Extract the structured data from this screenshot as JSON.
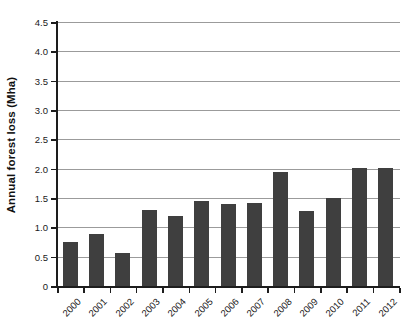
{
  "chart_data": {
    "type": "bar",
    "title": "",
    "xlabel": "",
    "ylabel": "Annual forest loss (Mha)",
    "categories": [
      "2000",
      "2001",
      "2002",
      "2003",
      "2004",
      "2005",
      "2006",
      "2007",
      "2008",
      "2009",
      "2010",
      "2011",
      "2012"
    ],
    "values": [
      0.75,
      0.88,
      0.56,
      1.3,
      1.19,
      1.45,
      1.4,
      1.41,
      1.95,
      1.28,
      1.5,
      2.02,
      2.02
    ],
    "series": [
      {
        "name": "Annual forest loss",
        "values": [
          0.75,
          0.88,
          0.56,
          1.3,
          1.19,
          1.45,
          1.4,
          1.41,
          1.95,
          1.28,
          1.5,
          2.02,
          2.02
        ]
      }
    ],
    "ylim": [
      0,
      4.5
    ],
    "ytick_labels": [
      "0",
      "0.5",
      "1.0",
      "1.5",
      "2.0",
      "2.5",
      "3.0",
      "3.5",
      "4.0",
      "4.5"
    ],
    "ytick_values": [
      0,
      0.5,
      1.0,
      1.5,
      2.0,
      2.5,
      3.0,
      3.5,
      4.0,
      4.5
    ],
    "grid": true,
    "gridline_axis": "y",
    "legend": false,
    "legend_position": "none",
    "bar_color": "#3f3f3f",
    "gridline_color": "#9b9b9b",
    "axis_color": "#1d1d1d",
    "background_color": "#ffffff",
    "xtick_label_rotation_degrees": 45
  }
}
